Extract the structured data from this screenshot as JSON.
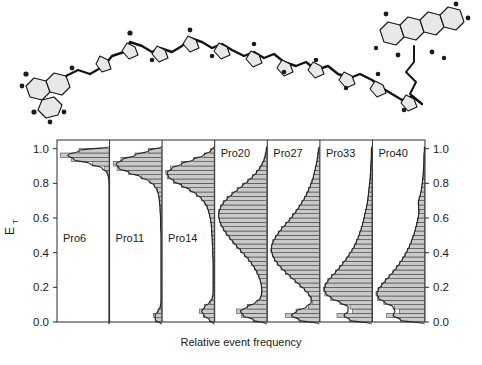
{
  "figure": {
    "molecule": {
      "name": "polyproline-peptide-structure",
      "description": "Extended polyproline helix with donor and acceptor dye labels"
    }
  },
  "chart_data": {
    "type": "bar",
    "orientation": "horizontal",
    "title": "",
    "xlabel": "Relative event frequency",
    "ylabel": "E_T",
    "ylabel_base": "E",
    "ylabel_sub": "T",
    "ylim": [
      0.0,
      1.05
    ],
    "xlim": [
      0,
      1
    ],
    "grid": false,
    "legend_position": "none",
    "axis_left_ticks": [
      "0.0",
      "0.2",
      "0.4",
      "0.6",
      "0.8",
      "1.0"
    ],
    "axis_right_ticks": [
      "0.0",
      "0.2",
      "0.4",
      "0.6",
      "0.8",
      "1.0"
    ],
    "axis_tick_values": [
      0.0,
      0.2,
      0.4,
      0.6,
      0.8,
      1.0
    ],
    "bin_width": 0.025,
    "bin_centers": [
      0.0125,
      0.0375,
      0.0625,
      0.0875,
      0.1125,
      0.1375,
      0.1625,
      0.1875,
      0.2125,
      0.2375,
      0.2625,
      0.2875,
      0.3125,
      0.3375,
      0.3625,
      0.3875,
      0.4125,
      0.4375,
      0.4625,
      0.4875,
      0.5125,
      0.5375,
      0.5625,
      0.5875,
      0.6125,
      0.6375,
      0.6625,
      0.6875,
      0.7125,
      0.7375,
      0.7625,
      0.7875,
      0.8125,
      0.8375,
      0.8625,
      0.8875,
      0.9125,
      0.9375,
      0.9625,
      0.9875
    ],
    "panels": [
      {
        "label": "Pro6",
        "peak_high": 0.94,
        "peak_low": null,
        "values": [
          0.0,
          0.0,
          0.0,
          0.0,
          0.0,
          0.0,
          0.0,
          0.0,
          0.0,
          0.0,
          0.0,
          0.0,
          0.0,
          0.0,
          0.0,
          0.0,
          0.0,
          0.0,
          0.0,
          0.0,
          0.0,
          0.0,
          0.0,
          0.0,
          0.0,
          0.0,
          0.0,
          0.0,
          0.0,
          0.0,
          0.0,
          0.0,
          0.0,
          0.01,
          0.03,
          0.1,
          0.34,
          0.78,
          1.0,
          0.62
        ]
      },
      {
        "label": "Pro11",
        "peak_high": 0.88,
        "peak_low": 0.03,
        "values": [
          0.13,
          0.17,
          0.06,
          0.02,
          0.01,
          0.01,
          0.01,
          0.01,
          0.01,
          0.01,
          0.01,
          0.01,
          0.01,
          0.01,
          0.01,
          0.01,
          0.01,
          0.01,
          0.01,
          0.01,
          0.01,
          0.02,
          0.02,
          0.02,
          0.02,
          0.03,
          0.03,
          0.04,
          0.05,
          0.06,
          0.09,
          0.14,
          0.24,
          0.42,
          0.68,
          0.92,
          1.0,
          0.84,
          0.55,
          0.27
        ]
      },
      {
        "label": "Pro14",
        "peak_high": 0.8,
        "peak_low": 0.05,
        "values": [
          0.1,
          0.22,
          0.3,
          0.2,
          0.08,
          0.03,
          0.02,
          0.02,
          0.02,
          0.02,
          0.02,
          0.02,
          0.02,
          0.02,
          0.02,
          0.03,
          0.03,
          0.03,
          0.04,
          0.04,
          0.05,
          0.05,
          0.06,
          0.07,
          0.09,
          0.11,
          0.14,
          0.19,
          0.26,
          0.36,
          0.5,
          0.67,
          0.84,
          0.97,
          1.0,
          0.9,
          0.68,
          0.42,
          0.2,
          0.07
        ]
      },
      {
        "label": "Pro20",
        "peak_high": 0.62,
        "peak_low": 0.05,
        "values": [
          0.28,
          0.52,
          0.62,
          0.4,
          0.2,
          0.12,
          0.1,
          0.1,
          0.11,
          0.13,
          0.16,
          0.2,
          0.25,
          0.31,
          0.38,
          0.46,
          0.54,
          0.62,
          0.7,
          0.77,
          0.84,
          0.9,
          0.95,
          0.98,
          1.0,
          0.99,
          0.96,
          0.9,
          0.82,
          0.72,
          0.61,
          0.5,
          0.39,
          0.29,
          0.21,
          0.14,
          0.09,
          0.05,
          0.03,
          0.01
        ]
      },
      {
        "label": "Pro27",
        "peak_high": 0.42,
        "peak_low": 0.03,
        "values": [
          0.42,
          0.7,
          0.48,
          0.22,
          0.14,
          0.16,
          0.22,
          0.3,
          0.4,
          0.5,
          0.6,
          0.7,
          0.79,
          0.87,
          0.93,
          0.97,
          1.0,
          0.99,
          0.96,
          0.91,
          0.85,
          0.78,
          0.7,
          0.62,
          0.55,
          0.48,
          0.42,
          0.36,
          0.31,
          0.26,
          0.22,
          0.18,
          0.15,
          0.12,
          0.1,
          0.08,
          0.06,
          0.04,
          0.03,
          0.02
        ]
      },
      {
        "label": "Pro33",
        "peak_high": 0.17,
        "peak_low": 0.03,
        "values": [
          0.46,
          0.72,
          0.4,
          0.45,
          0.66,
          0.85,
          0.97,
          1.0,
          0.97,
          0.91,
          0.83,
          0.75,
          0.67,
          0.6,
          0.53,
          0.47,
          0.41,
          0.36,
          0.32,
          0.28,
          0.25,
          0.22,
          0.19,
          0.17,
          0.15,
          0.13,
          0.11,
          0.09,
          0.08,
          0.07,
          0.06,
          0.05,
          0.04,
          0.03,
          0.03,
          0.02,
          0.02,
          0.01,
          0.01,
          0.01
        ]
      },
      {
        "label": "Pro40",
        "peak_high": 0.13,
        "peak_low": 0.02,
        "values": [
          0.5,
          0.78,
          0.52,
          0.62,
          0.84,
          0.97,
          1.0,
          0.96,
          0.89,
          0.81,
          0.73,
          0.65,
          0.58,
          0.51,
          0.45,
          0.4,
          0.35,
          0.31,
          0.27,
          0.24,
          0.21,
          0.18,
          0.16,
          0.14,
          0.12,
          0.11,
          0.12,
          0.13,
          0.11,
          0.08,
          0.06,
          0.05,
          0.04,
          0.03,
          0.02,
          0.02,
          0.01,
          0.01,
          0.01,
          0.0
        ]
      }
    ]
  }
}
